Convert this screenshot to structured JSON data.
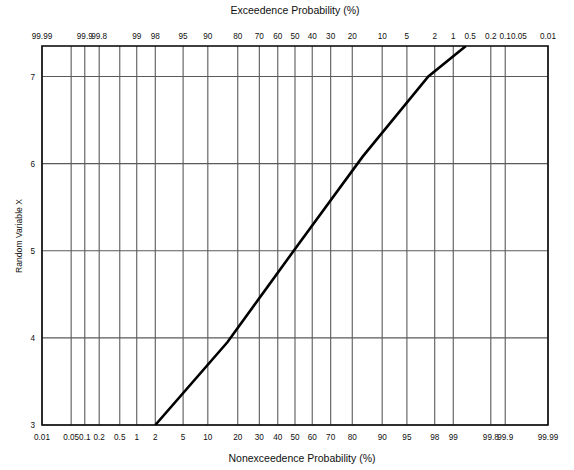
{
  "chart_data": {
    "type": "line",
    "title": "",
    "plot_kind": "normal-probability-paper",
    "top_axis": {
      "label": "Exceedence Probability (%)",
      "ticks": [
        99.99,
        99.9,
        99.8,
        99,
        98,
        95,
        90,
        80,
        70,
        60,
        50,
        40,
        30,
        20,
        10,
        5,
        2,
        1,
        0.5,
        0.2,
        0.1,
        0.05,
        0.01
      ],
      "tick_labels": [
        "99.99",
        "99.9",
        "99.8",
        "99",
        "98",
        "95",
        "90",
        "80",
        "70",
        "60",
        "50",
        "40",
        "30",
        "20",
        "10",
        "5",
        "2",
        "1",
        "0.5",
        "0.2",
        "0.1",
        "0.05",
        "0.01"
      ],
      "direction": "decreasing-left-to-right"
    },
    "bottom_axis": {
      "label": "Nonexceedence Probability (%)",
      "ticks": [
        0.01,
        0.05,
        0.1,
        0.2,
        0.5,
        1,
        2,
        5,
        10,
        20,
        30,
        40,
        50,
        60,
        70,
        80,
        90,
        95,
        98,
        99,
        99.8,
        99.9,
        99.99
      ],
      "tick_labels": [
        "0.01",
        "0.05",
        "0.1",
        "0.2",
        "0.5",
        "1",
        "2",
        "5",
        "10",
        "20",
        "30",
        "40",
        "50",
        "60",
        "70",
        "80",
        "90",
        "95",
        "98",
        "99",
        "99.8",
        "99.9",
        "99.99"
      ],
      "direction": "increasing-left-to-right"
    },
    "ylabel": "Random Variable X",
    "yticks": [
      3,
      4,
      5,
      6,
      7
    ],
    "ytick_labels": [
      "3",
      "4",
      "5",
      "6",
      "7"
    ],
    "ylim": [
      3,
      7.35
    ],
    "grid": true,
    "legend": null,
    "series": [
      {
        "name": "fitted normal line",
        "comment": "straight line on normal probability paper",
        "points": [
          {
            "p_nonexceedence": 2.0,
            "x_value": 3.0
          },
          {
            "p_nonexceedence": 16.0,
            "x_value": 3.95
          },
          {
            "p_nonexceedence": 50.0,
            "x_value": 5.02
          },
          {
            "p_nonexceedence": 84.0,
            "x_value": 6.08
          },
          {
            "p_nonexceedence": 97.5,
            "x_value": 7.0
          },
          {
            "p_nonexceedence": 99.4,
            "x_value": 7.35
          }
        ],
        "color": "#000000",
        "width_px": 2.6
      }
    ]
  },
  "axis_titles": {
    "top": "Exceedence Probability (%)",
    "bottom": "Nonexceedence Probability (%)",
    "left": "Random Variable X"
  },
  "colors": {
    "line": "#000000",
    "grid": "#5a5a5a",
    "frame": "#101010",
    "background": "#ffffff",
    "text": "#101010"
  }
}
